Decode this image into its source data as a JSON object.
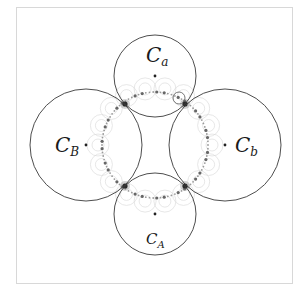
{
  "figure": {
    "width": 303,
    "height": 293,
    "frame": {
      "x": 16,
      "y": 7,
      "width": 277,
      "height": 277
    },
    "colors": {
      "circle_stroke": "#3a3a3a",
      "faint_stroke": "#d6d6d6",
      "dot": "#222222"
    }
  },
  "circles": [
    {
      "id": "Ca",
      "label_main": "C",
      "label_sub": "a",
      "cx": 155,
      "cy": 76,
      "r": 41,
      "label_x": 146,
      "label_y": 62
    },
    {
      "id": "Cb",
      "label_main": "C",
      "label_sub": "b",
      "cx": 225,
      "cy": 145,
      "r": 56,
      "label_x": 235,
      "label_y": 152
    },
    {
      "id": "CA",
      "label_main": "C",
      "label_sub": "A",
      "cx": 155,
      "cy": 214,
      "r": 41,
      "label_x": 146,
      "label_y": 244
    },
    {
      "id": "CB",
      "label_main": "C",
      "label_sub": "B",
      "cx": 86,
      "cy": 145,
      "r": 56,
      "label_x": 55,
      "label_y": 152
    }
  ],
  "tangent_points": [
    {
      "x": 125,
      "y": 104
    },
    {
      "x": 185,
      "y": 104
    },
    {
      "x": 185,
      "y": 186
    },
    {
      "x": 125,
      "y": 186
    }
  ],
  "inner_chain": {
    "cx": 155,
    "cy": 145,
    "r": 53
  }
}
